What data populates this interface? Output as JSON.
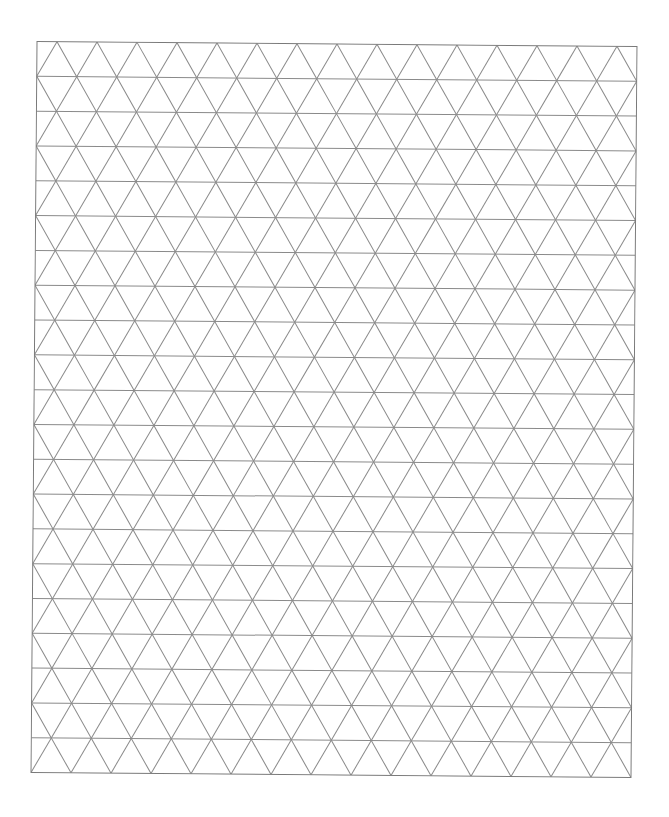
{
  "page": {
    "background": "#ffffff"
  },
  "grid": {
    "type": "isometric-triangle",
    "columns": 15,
    "rows": 21,
    "cell_width_px": 40,
    "row_height_px": 34.8,
    "line_color": "#8a8a8a",
    "border_color": "#7a7a7a",
    "line_width_px": 1,
    "rotation_deg": 0.47,
    "first_row_apex_offset_px": 20
  }
}
